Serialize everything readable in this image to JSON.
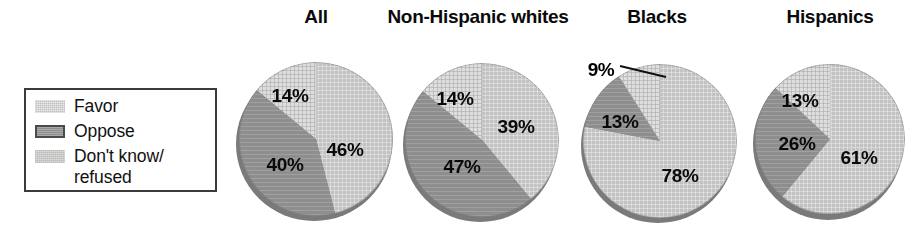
{
  "legend": {
    "items": [
      {
        "label": "Favor",
        "key": "favor",
        "color": "#bfbfbf"
      },
      {
        "label": "Oppose",
        "key": "oppose",
        "color": "#8e8e8e"
      },
      {
        "label": "Don't know/\nrefused",
        "key": "dk",
        "color": "#dededa"
      }
    ]
  },
  "chart_data": {
    "type": "pie",
    "title": "",
    "legend_position": "left",
    "categories": [
      "Favor",
      "Oppose",
      "Don't know/refused"
    ],
    "colors": {
      "Favor": "#bfbfbf",
      "Oppose": "#8e8e8e",
      "Don't know/refused": "#dededa"
    },
    "units": "percent",
    "pies": [
      {
        "title": "All",
        "slices": [
          {
            "name": "Favor",
            "value": 46,
            "label": "46%"
          },
          {
            "name": "Oppose",
            "value": 40,
            "label": "40%"
          },
          {
            "name": "Don't know/refused",
            "value": 14,
            "label": "14%"
          }
        ]
      },
      {
        "title": "Non-Hispanic whites",
        "slices": [
          {
            "name": "Favor",
            "value": 39,
            "label": "39%"
          },
          {
            "name": "Oppose",
            "value": 47,
            "label": "47%"
          },
          {
            "name": "Don't know/refused",
            "value": 14,
            "label": "14%"
          }
        ]
      },
      {
        "title": "Blacks",
        "slices": [
          {
            "name": "Favor",
            "value": 78,
            "label": "78%"
          },
          {
            "name": "Oppose",
            "value": 13,
            "label": "13%"
          },
          {
            "name": "Don't know/refused",
            "value": 9,
            "label": "9%"
          }
        ]
      },
      {
        "title": "Hispanics",
        "slices": [
          {
            "name": "Favor",
            "value": 61,
            "label": "61%"
          },
          {
            "name": "Oppose",
            "value": 26,
            "label": "26%"
          },
          {
            "name": "Don't know/refused",
            "value": 13,
            "label": "13%"
          }
        ]
      }
    ]
  },
  "layout": {
    "pies": [
      {
        "cx": 316,
        "cy": 139,
        "rx": 78,
        "ry": 77,
        "title_x": 316,
        "title_y": 6,
        "labels": [
          {
            "slice": 0,
            "x": 345,
            "y": 150,
            "outside": false
          },
          {
            "slice": 1,
            "x": 285,
            "y": 165,
            "outside": false
          },
          {
            "slice": 2,
            "x": 290,
            "y": 96,
            "outside": false
          }
        ]
      },
      {
        "cx": 482,
        "cy": 140,
        "rx": 77,
        "ry": 77,
        "title_x": 478,
        "title_y": 6,
        "labels": [
          {
            "slice": 0,
            "x": 516,
            "y": 127,
            "outside": false
          },
          {
            "slice": 1,
            "x": 462,
            "y": 167,
            "outside": false
          },
          {
            "slice": 2,
            "x": 455,
            "y": 99,
            "outside": false
          }
        ]
      },
      {
        "cx": 660,
        "cy": 141,
        "rx": 77,
        "ry": 77,
        "title_x": 657,
        "title_y": 6,
        "labels": [
          {
            "slice": 0,
            "x": 680,
            "y": 176,
            "outside": false
          },
          {
            "slice": 1,
            "x": 620,
            "y": 122,
            "outside": false
          },
          {
            "slice": 2,
            "x": 601,
            "y": 70,
            "outside": true
          }
        ]
      },
      {
        "cx": 830,
        "cy": 139,
        "rx": 75,
        "ry": 76,
        "title_x": 830,
        "title_y": 6,
        "labels": [
          {
            "slice": 0,
            "x": 859,
            "y": 158,
            "outside": false
          },
          {
            "slice": 1,
            "x": 797,
            "y": 144,
            "outside": false
          },
          {
            "slice": 2,
            "x": 800,
            "y": 101,
            "outside": false
          }
        ]
      }
    ],
    "leader_line": {
      "x1": 620,
      "y1": 66,
      "x2": 666,
      "y2": 77
    }
  }
}
